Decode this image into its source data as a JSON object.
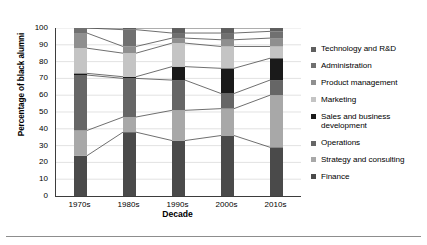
{
  "axes": {
    "y_title": "Percentage of black alumni",
    "x_title": "Decade",
    "y_ticks": [
      "0",
      "10",
      "20",
      "30",
      "40",
      "50",
      "60",
      "70",
      "80",
      "90",
      "100"
    ],
    "x_ticks": [
      "1970s",
      "1980s",
      "1990s",
      "2000s",
      "2010s"
    ]
  },
  "legend": {
    "items": [
      {
        "label": "Technology and R&D",
        "color": "#5f5f5f"
      },
      {
        "label": "Administration",
        "color": "#707070"
      },
      {
        "label": "Product management",
        "color": "#8f8f8f"
      },
      {
        "label": "Marketing",
        "color": "#c4c4c4"
      },
      {
        "label": "Sales and business development",
        "color": "#1a1a1a"
      },
      {
        "label": "Operations",
        "color": "#666666"
      },
      {
        "label": "Strategy and consulting",
        "color": "#a8a8a8"
      },
      {
        "label": "Finance",
        "color": "#4a4a4a"
      }
    ]
  },
  "chart_data": {
    "type": "area",
    "title": "",
    "xlabel": "Decade",
    "ylabel": "Percentage of black alumni",
    "ylim": [
      0,
      100
    ],
    "ytick_step": 10,
    "grid": true,
    "grid_axis": "y",
    "legend_position": "right",
    "stacked": true,
    "stack_order_bottom_to_top": [
      "Finance",
      "Strategy and consulting",
      "Operations",
      "Sales and business development",
      "Marketing",
      "Product management",
      "Administration",
      "Technology and R&D"
    ],
    "categories": [
      "1970s",
      "1980s",
      "1990s",
      "2000s",
      "2010s"
    ],
    "series": [
      {
        "name": "Finance",
        "color": "#4a4a4a",
        "values": [
          24,
          38,
          33,
          36,
          29
        ]
      },
      {
        "name": "Strategy and consulting",
        "color": "#a8a8a8",
        "values": [
          15,
          9,
          18,
          16,
          31
        ]
      },
      {
        "name": "Operations",
        "color": "#666666",
        "values": [
          33,
          23,
          18,
          9,
          9
        ]
      },
      {
        "name": "Sales and business development",
        "color": "#1a1a1a",
        "values": [
          1,
          1,
          8,
          15,
          13
        ]
      },
      {
        "name": "Marketing",
        "color": "#c4c4c4",
        "values": [
          15,
          14,
          14,
          13,
          7
        ]
      },
      {
        "name": "Product management",
        "color": "#8f8f8f",
        "values": [
          9,
          4,
          3,
          4,
          5
        ]
      },
      {
        "name": "Administration",
        "color": "#707070",
        "values": [
          3,
          10,
          3,
          4,
          4
        ]
      },
      {
        "name": "Technology and R&D",
        "color": "#5f5f5f",
        "values": [
          0,
          1,
          3,
          3,
          2
        ]
      }
    ],
    "cumulative_boundaries": {
      "1970s": [
        24,
        39,
        72,
        73,
        88,
        97,
        100,
        100
      ],
      "1980s": [
        38,
        47,
        70,
        71,
        85,
        89,
        99,
        100
      ],
      "1990s": [
        33,
        51,
        69,
        77,
        91,
        94,
        97,
        100
      ],
      "2000s": [
        36,
        52,
        61,
        76,
        89,
        93,
        97,
        100
      ],
      "2010s": [
        29,
        60,
        69,
        82,
        89,
        94,
        98,
        100
      ]
    }
  }
}
